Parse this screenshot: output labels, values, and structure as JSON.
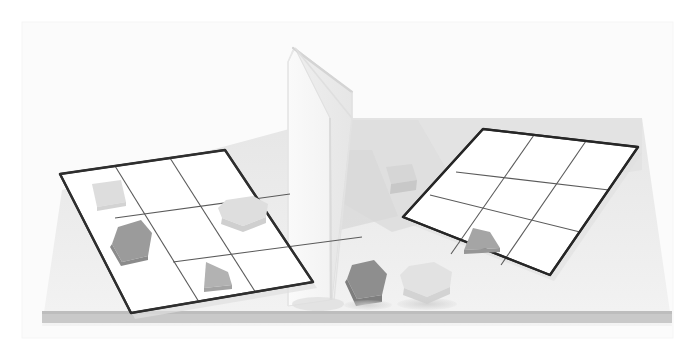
{
  "scene": {
    "title": "Two-sided 3x3 grid board scene with divider wall",
    "canvas": {
      "width": 695,
      "height": 360
    },
    "background_color": "#ffffff",
    "frame": {
      "label": "image-frame",
      "color": "#f2f2f2",
      "x": 22,
      "y": 22,
      "width": 651,
      "height": 316
    }
  },
  "table": {
    "label": "table-surface",
    "top_color": "#ececec",
    "top_shade_color": "#e3e3e3",
    "front_edge_color": "#fbfbfb",
    "front_strip_color": "#c9c9c9",
    "shadow_color": "#d9d9d9",
    "points_top": "62,190 330,118 640,118 672,330 42,330"
  },
  "divider_wall": {
    "label": "divider-wall",
    "description": "Folded white screen separating the two halves",
    "left_panel_color": "#f7f7f7",
    "right_panel_color": "#ededed",
    "edge_color": "#dcdcdc",
    "crease_color": "#d6d6d6",
    "apex_x": 295,
    "apex_y": 48
  },
  "boards": [
    {
      "id": "left-board",
      "label": "Left 3x3 grid board",
      "rows": 3,
      "cols": 3,
      "border_color": "#333333",
      "grid_line_color": "#555555",
      "cell_fill": "#ffffff",
      "corners": {
        "top_left": [
          60,
          174
        ],
        "top_right": [
          225,
          150
        ],
        "bottom_right": [
          313,
          282
        ],
        "bottom_left": [
          131,
          313
        ]
      },
      "occupied_cells": [
        {
          "row": 0,
          "col": 0,
          "shape": "square",
          "color": "#cfcfcf"
        },
        {
          "row": 1,
          "col": 0,
          "shape": "pentagon",
          "color": "#9a9a9a"
        },
        {
          "row": 1,
          "col": 2,
          "shape": "hexagon",
          "color": "#dcdcdc"
        },
        {
          "row": 2,
          "col": 1,
          "shape": "triangle",
          "color": "#b4b4b4"
        }
      ]
    },
    {
      "id": "right-board",
      "label": "Right 3x3 grid board",
      "rows": 3,
      "cols": 3,
      "border_color": "#2b2b2b",
      "grid_line_color": "#555555",
      "cell_fill": "#ffffff",
      "corners": {
        "top_left": [
          483,
          129
        ],
        "top_right": [
          638,
          147
        ],
        "bottom_right": [
          550,
          275
        ],
        "bottom_left": [
          403,
          217
        ]
      },
      "occupied_cells": [
        {
          "row": 2,
          "col": 1,
          "shape": "triangle",
          "color": "#a6a6a6"
        }
      ]
    }
  ],
  "loose_objects": [
    {
      "id": "cube-near-wall",
      "label": "Light gray cube beside wall",
      "shape": "cube",
      "color": "#d8d8d8",
      "side_color": "#cbcbcb",
      "x": 392,
      "y": 172
    },
    {
      "id": "dark-pentagon-front",
      "label": "Dark gray pentagon on table",
      "shape": "pentagon",
      "color": "#8e8e8e",
      "side_color": "#7d7d7d",
      "x": 366,
      "y": 270
    },
    {
      "id": "light-hexagon-front",
      "label": "Light gray hexagon on table",
      "shape": "hexagon",
      "color": "#e0e0e0",
      "side_color": "#d2d2d2",
      "x": 424,
      "y": 278
    }
  ],
  "palette": {
    "white": "#ffffff",
    "frame_gray": "#f2f2f2",
    "table_gray": "#ececec",
    "strip_gray": "#c9c9c9",
    "shape_dark": "#8e8e8e",
    "shape_mid": "#b4b4b4",
    "shape_light": "#dcdcdc",
    "outline_dark": "#2b2b2b"
  }
}
